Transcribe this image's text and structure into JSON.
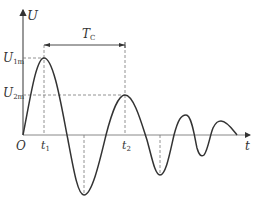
{
  "diagram": {
    "type": "damped-oscillation-waveform",
    "axes": {
      "y_label": "U",
      "x_label": "t",
      "origin_label": "O"
    },
    "markers": {
      "t1": {
        "main": "t",
        "sub": "1"
      },
      "t2": {
        "main": "t",
        "sub": "2"
      },
      "U1m": {
        "main": "U",
        "sub": "1m"
      },
      "U2m": {
        "main": "U",
        "sub": "2m"
      },
      "period": {
        "main": "T",
        "sub": "C"
      }
    },
    "colors": {
      "curve": "#333333",
      "axes": "#555555",
      "dashed": "#777777",
      "background": "#ffffff"
    }
  }
}
